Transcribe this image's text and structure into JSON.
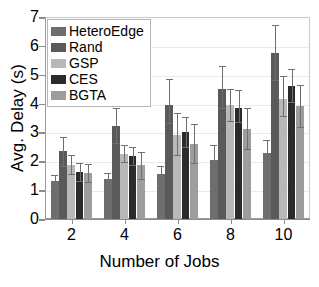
{
  "chart_data": {
    "type": "bar",
    "title": "",
    "xlabel": "Number of Jobs",
    "ylabel": "Avg. Delay (s)",
    "categories": [
      "2",
      "4",
      "6",
      "8",
      "10"
    ],
    "ylim": [
      0,
      7
    ],
    "yticks": [
      "0",
      "1",
      "2",
      "3",
      "4",
      "5",
      "6",
      "7"
    ],
    "grid": true,
    "legend_position": "upper left",
    "series": [
      {
        "name": "HeteroEdge",
        "color": "#6e6e6e",
        "values": [
          1.32,
          1.4,
          1.55,
          2.05,
          2.28
        ],
        "err_low": [
          0.22,
          0.18,
          0.3,
          0.5,
          0.47
        ],
        "err_high": [
          0.22,
          0.18,
          0.3,
          0.5,
          0.47
        ]
      },
      {
        "name": "Rand",
        "color": "#5a5a5a",
        "values": [
          2.34,
          3.24,
          3.96,
          4.52,
          5.75
        ],
        "err_low": [
          0.5,
          0.62,
          0.63,
          0.68,
          0.95
        ],
        "err_high": [
          0.5,
          0.62,
          0.9,
          0.78,
          0.97
        ]
      },
      {
        "name": "GSP",
        "color": "#b8b8b8",
        "values": [
          1.88,
          2.26,
          2.9,
          3.95,
          4.17
        ],
        "err_low": [
          0.33,
          0.3,
          0.68,
          0.55,
          0.6
        ],
        "err_high": [
          0.33,
          0.3,
          0.78,
          0.55,
          0.77
        ]
      },
      {
        "name": "CES",
        "color": "#2b2b2b",
        "values": [
          1.63,
          2.18,
          3.01,
          3.85,
          4.62
        ],
        "err_low": [
          0.3,
          0.3,
          0.52,
          0.5,
          0.55
        ],
        "err_high": [
          0.3,
          0.3,
          0.52,
          0.62,
          0.58
        ]
      },
      {
        "name": "BGTA",
        "color": "#9d9d9d",
        "values": [
          1.59,
          1.86,
          2.61,
          3.13,
          3.92
        ],
        "err_low": [
          0.3,
          0.46,
          0.68,
          0.72,
          0.72
        ]
      }
    ]
  }
}
